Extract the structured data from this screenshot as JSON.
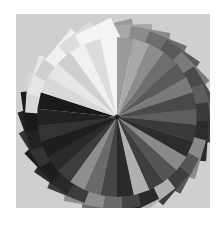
{
  "image": {
    "description": "Grayscale photograph of paper color swatch sheets fanned out in a circular spiral",
    "background": "#cfcfcf",
    "center": [
      101,
      103
    ],
    "sheets": [
      {
        "angle": -90,
        "tone": "#9a9a9a"
      },
      {
        "angle": -78,
        "tone": "#a8a8a8"
      },
      {
        "angle": -66,
        "tone": "#8c8c8c"
      },
      {
        "angle": -54,
        "tone": "#6e6e6e"
      },
      {
        "angle": -42,
        "tone": "#5a5a5a"
      },
      {
        "angle": -30,
        "tone": "#7a7a7a"
      },
      {
        "angle": -18,
        "tone": "#4a4a4a"
      },
      {
        "angle": -6,
        "tone": "#5e5e5e"
      },
      {
        "angle": 6,
        "tone": "#3a3a3a"
      },
      {
        "angle": 18,
        "tone": "#2c2c2c"
      },
      {
        "angle": 30,
        "tone": "#8a8a8a"
      },
      {
        "angle": 42,
        "tone": "#555555"
      },
      {
        "angle": 54,
        "tone": "#3e3e3e"
      },
      {
        "angle": 66,
        "tone": "#b0b0b0"
      },
      {
        "angle": 78,
        "tone": "#2a2a2a"
      },
      {
        "angle": 90,
        "tone": "#454545"
      },
      {
        "angle": 102,
        "tone": "#6a6a6a"
      },
      {
        "angle": 114,
        "tone": "#8e8e8e"
      },
      {
        "angle": 126,
        "tone": "#3c3c3c"
      },
      {
        "angle": 138,
        "tone": "#2a2a2a"
      },
      {
        "angle": 150,
        "tone": "#1e1e1e"
      },
      {
        "angle": 162,
        "tone": "#333333"
      },
      {
        "angle": 174,
        "tone": "#222222"
      },
      {
        "angle": 186,
        "tone": "#1a1a1a"
      },
      {
        "angle": 198,
        "tone": "#d8d8d8"
      },
      {
        "angle": 210,
        "tone": "#e6e6e6"
      },
      {
        "angle": 222,
        "tone": "#cfcfcf"
      },
      {
        "angle": 234,
        "tone": "#f0f0f0"
      },
      {
        "angle": 246,
        "tone": "#dcdcdc"
      },
      {
        "angle": 258,
        "tone": "#f4f4f4"
      }
    ]
  }
}
